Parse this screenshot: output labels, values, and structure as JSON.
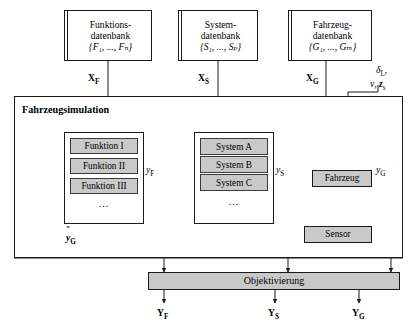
{
  "diagram": {
    "title_block": "Fahrzeugsimulation",
    "databases": [
      {
        "name": "funktions-datenbank",
        "line1": "Funktions-",
        "line2": "datenbank",
        "set": "{F₁, ..., Fₙ}"
      },
      {
        "name": "system-datenbank",
        "line1": "System-",
        "line2": "datenbank",
        "set": "{S₁, ..., Sₚ}"
      },
      {
        "name": "fahrzeug-datenbank",
        "line1": "Fahrzeug-",
        "line2": "datenbank",
        "set": "{G₁, ..., Gₘ}"
      }
    ],
    "function_group": {
      "items": [
        "Funktion I",
        "Funktion II",
        "Funktion III"
      ],
      "ellipsis": "..."
    },
    "system_group": {
      "items": [
        "System A",
        "System B",
        "System C"
      ],
      "ellipsis": "..."
    },
    "plant_blocks": {
      "vehicle": "Fahrzeug",
      "sensor": "Sensor"
    },
    "objectification": "Objektivierung",
    "input_labels": {
      "xf": "X",
      "xf_sub": "F",
      "xs": "X",
      "xs_sub": "S",
      "xg": "X",
      "xg_sub": "G"
    },
    "disturbance_labels": {
      "line1": "δ",
      "line1_sub": "L",
      "line1_tail": ",",
      "line2_v": "v",
      "line2_sep": ",",
      "line2_z": "z",
      "line2_z_sub": "s"
    },
    "signal_labels": {
      "yf": "y",
      "yf_sub": "F",
      "ys": "y",
      "ys_sub": "S",
      "yg": "y",
      "yg_sub": "G",
      "yg_tilde_base": "y",
      "yg_tilde_sub": "G",
      "yg_tilde_mark": "˜"
    },
    "output_labels": {
      "yf": "Y",
      "yf_sub": "F",
      "ys": "Y",
      "ys_sub": "S",
      "yg": "Y",
      "yg_sub": "G"
    },
    "colors": {
      "fill_gray": "#c9c9c9",
      "line": "#1a1a1a",
      "background": "#ffffff"
    }
  }
}
